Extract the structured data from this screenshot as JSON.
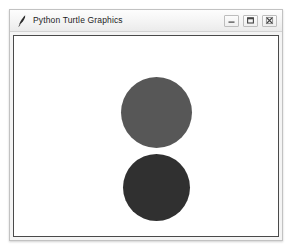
{
  "window": {
    "title": "Python Turtle Graphics",
    "icon": "python-feather-icon",
    "frame_color": "#c2c2c2",
    "titlebar_color": "#f3f3f3",
    "controls": [
      {
        "name": "minimize-button",
        "label": "Minimize",
        "glyph": "minimize-icon"
      },
      {
        "name": "maximize-button",
        "label": "Maximize",
        "glyph": "maximize-icon"
      },
      {
        "name": "close-button",
        "label": "Close",
        "glyph": "close-icon"
      }
    ]
  },
  "canvas": {
    "background_color": "#ffffff",
    "border_color": "#4a4a4a",
    "shapes": [
      {
        "name": "upper-circle",
        "type": "circle",
        "fill": "#575757",
        "center_x": 142,
        "center_y": 76,
        "diameter": 71
      },
      {
        "name": "lower-circle",
        "type": "circle",
        "fill": "#303030",
        "center_x": 142,
        "center_y": 151,
        "diameter": 67
      }
    ]
  }
}
